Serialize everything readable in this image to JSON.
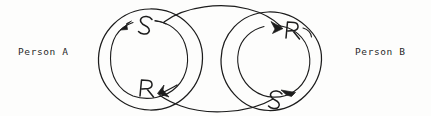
{
  "diagram": {
    "type": "hand-drawn-communication-loop",
    "background_color": "#fdfdfc",
    "ink_color": "#1c1c1c",
    "labels": {
      "person_a": "Person A",
      "person_b": "Person B"
    },
    "left_cycle": {
      "owner": "Person A",
      "top_node": "S",
      "bottom_node": "R",
      "direction": "counterclockwise"
    },
    "right_cycle": {
      "owner": "Person B",
      "top_node": "R",
      "bottom_node": "S",
      "direction": "clockwise"
    },
    "connections": [
      {
        "name": "top-arc",
        "from": "left-S",
        "to": "right-R",
        "arrowhead": "right-R"
      },
      {
        "name": "bottom-arc",
        "from": "right-S",
        "to": "left-R",
        "arrowhead": "left-R"
      }
    ]
  }
}
